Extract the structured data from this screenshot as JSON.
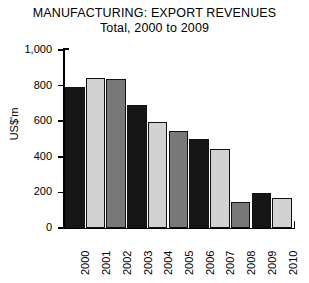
{
  "chart_data": {
    "type": "bar",
    "title": "MANUFACTURING: EXPORT REVENUES",
    "subtitle": "Total, 2000 to 2009",
    "xlabel": "",
    "ylabel": "US$'m",
    "ylim": [
      0,
      1000
    ],
    "yticks": [
      0,
      200,
      400,
      600,
      800,
      1000
    ],
    "ytick_labels": [
      "0",
      "200",
      "400",
      "600",
      "800",
      "1,000"
    ],
    "grid": false,
    "legend": false,
    "categories": [
      "2000",
      "2001",
      "2002",
      "2003",
      "2004",
      "2005",
      "2006",
      "2007",
      "2008",
      "2009",
      "2010"
    ],
    "values": [
      795,
      845,
      835,
      690,
      595,
      545,
      500,
      445,
      145,
      195,
      170
    ],
    "bar_colors": [
      "#161616",
      "#d2d2d2",
      "#787878",
      "#161616",
      "#d2d2d2",
      "#787878",
      "#161616",
      "#d2d2d2",
      "#787878",
      "#161616",
      "#d2d2d2",
      "#787878"
    ],
    "bar_edge_color": "#111111",
    "background": "#ffffff",
    "series": [
      {
        "name": "Export revenues",
        "values": [
          795,
          845,
          835,
          690,
          595,
          545,
          500,
          445,
          145,
          195,
          170
        ]
      }
    ]
  }
}
